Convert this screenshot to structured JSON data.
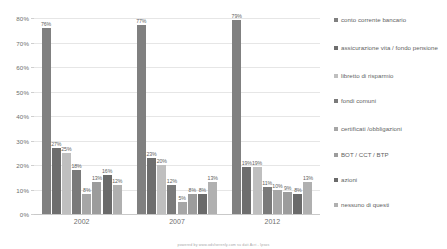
{
  "chart_data": {
    "type": "bar",
    "title": "",
    "xlabel": "",
    "ylabel": "",
    "ylim": [
      0,
      80
    ],
    "ytick_labels": [
      "80%",
      "70%",
      "60%",
      "50%",
      "40%",
      "30%",
      "20%",
      "10%",
      "0%"
    ],
    "ytick_values": [
      80,
      70,
      60,
      50,
      40,
      30,
      20,
      10,
      0
    ],
    "grid": true,
    "legend_position": "right",
    "categories": [
      "2002",
      "2007",
      "2012"
    ],
    "series": [
      {
        "name": "conto corrente bancario",
        "color": "#808080",
        "values": [
          76,
          77,
          79
        ],
        "labels": [
          "76%",
          "77%",
          "79%"
        ]
      },
      {
        "name": "assicurazione vita / fondo pensione",
        "color": "#6e6e6e",
        "values": [
          27,
          23,
          19
        ],
        "labels": [
          "27%",
          "23%",
          "19%"
        ]
      },
      {
        "name": "libretto di risparmio",
        "color": "#bfbfbf",
        "values": [
          25,
          20,
          19
        ],
        "labels": [
          "25%",
          "20%",
          "19%"
        ]
      },
      {
        "name": "fondi comuni",
        "color": "#7a7a7a",
        "values": [
          18,
          12,
          11
        ],
        "labels": [
          "18%",
          "12%",
          "11%"
        ]
      },
      {
        "name": "certificati /obbligazioni",
        "color": "#a6a6a6",
        "values": [
          8,
          5,
          10
        ],
        "labels": [
          "8%",
          "5%",
          "10%"
        ]
      },
      {
        "name": "BOT / CCT / BTP",
        "color": "#9c9c9c",
        "values": [
          13,
          8,
          9
        ],
        "labels": [
          "13%",
          "8%",
          "9%"
        ]
      },
      {
        "name": "azioni",
        "color": "#6a6a6a",
        "values": [
          16,
          8,
          8
        ],
        "labels": [
          "16%",
          "8%",
          "8%"
        ]
      },
      {
        "name": "nessuno di questi",
        "color": "#b0b0b0",
        "values": [
          12,
          13,
          13
        ],
        "labels": [
          "12%",
          "13%",
          "13%"
        ]
      }
    ]
  },
  "footer": {
    "credit": "powered by www.odvlserenly.com  su dati Acri - Ipsos"
  }
}
